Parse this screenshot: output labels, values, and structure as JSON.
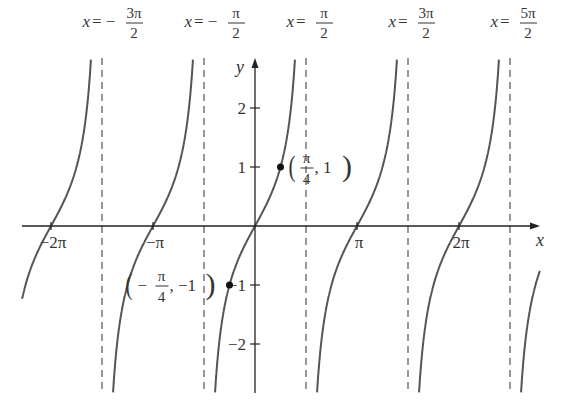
{
  "chart_data": {
    "type": "line",
    "title": "",
    "function": "y = tan x",
    "xlabel": "x",
    "ylabel": "y",
    "x_range": [
      -7.3,
      8.5
    ],
    "y_range": [
      -2.9,
      2.9
    ],
    "grid": false,
    "legend": null,
    "x_ticks": [
      {
        "value": -6.2832,
        "label": "−2π"
      },
      {
        "value": -3.1416,
        "label": "−π"
      },
      {
        "value": 3.1416,
        "label": "π"
      },
      {
        "value": 6.2832,
        "label": "2π"
      }
    ],
    "y_ticks": [
      {
        "value": 2,
        "label": "2"
      },
      {
        "value": 1,
        "label": "1"
      },
      {
        "value": -1,
        "label": "−1"
      },
      {
        "value": -2,
        "label": "−2"
      }
    ],
    "asymptotes": [
      {
        "value": -4.7124,
        "label_lhs": "x = −",
        "label_num": "3π",
        "label_den": "2"
      },
      {
        "value": -1.5708,
        "label_lhs": "x = −",
        "label_num": "π",
        "label_den": "2"
      },
      {
        "value": 1.5708,
        "label_lhs": "x = ",
        "label_num": "π",
        "label_den": "2"
      },
      {
        "value": 4.7124,
        "label_lhs": "x = ",
        "label_num": "3π",
        "label_den": "2"
      },
      {
        "value": 7.854,
        "label_lhs": "x = ",
        "label_num": "5π",
        "label_den": "2"
      }
    ],
    "points": [
      {
        "x": 0.7854,
        "y": 1,
        "label_num": "π",
        "label_den": "4",
        "label_rest": ", 1",
        "label_sign": ""
      },
      {
        "x": -0.7854,
        "y": -1,
        "label_num": "π",
        "label_den": "4",
        "label_rest": ", −1",
        "label_sign": "−"
      }
    ],
    "branches_centers": [
      -6.2832,
      -3.1416,
      0,
      3.1416,
      6.2832,
      9.4248
    ]
  },
  "axes": {
    "x_label": "x",
    "y_label": "y"
  }
}
